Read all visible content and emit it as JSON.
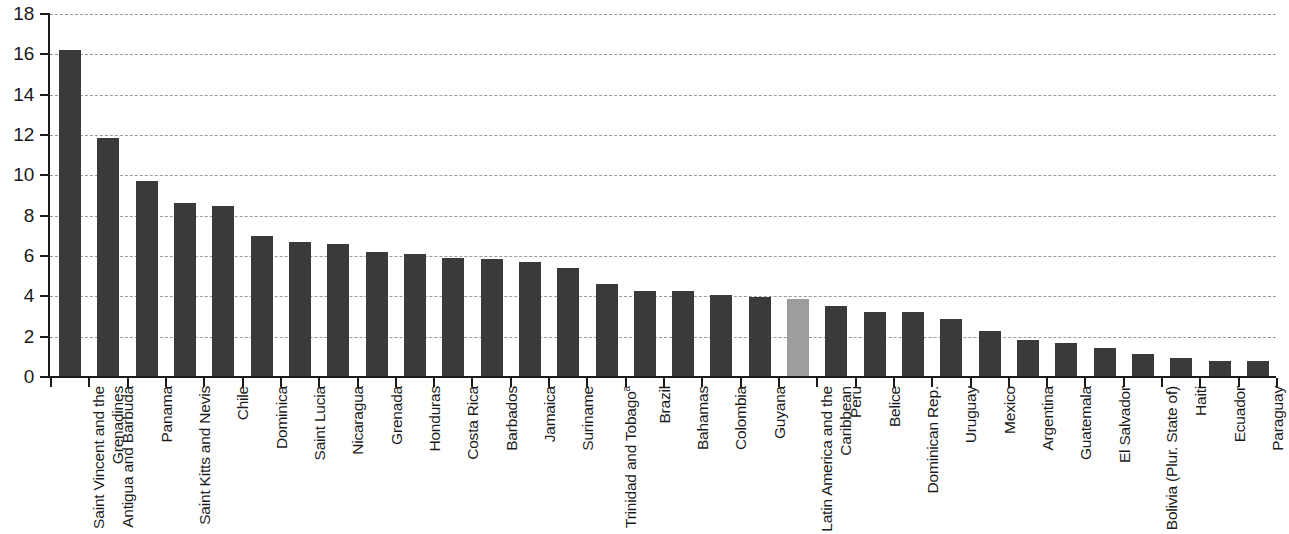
{
  "chart_data": {
    "type": "bar",
    "title": "",
    "subtitle": "",
    "xlabel": "",
    "ylabel": "",
    "ylim": [
      0,
      18
    ],
    "ytick_step": 2,
    "yticks": [
      "18",
      "16",
      "14",
      "12",
      "10",
      "8",
      "6",
      "4",
      "2",
      "0"
    ],
    "grid": true,
    "legend": false,
    "bar_color": "#3a3a3a",
    "highlight_color": "#9d9d9d",
    "highlight_category": "Latin America and the Caribbean",
    "footnote_marker": "a",
    "categories": [
      "Saint Vincent and the Grenadines",
      "Antigua and Barbuda",
      "Panama",
      "Saint Kitts and Nevis",
      "Chile",
      "Dominica",
      "Saint Lucia",
      "Nicaragua",
      "Grenada",
      "Honduras",
      "Costa Rica",
      "Barbados",
      "Jamaica",
      "Suriname",
      "Trinidad and Tobago",
      "Brazil",
      "Bahamas",
      "Colombia",
      "Guyana",
      "Latin America and the Caribbean",
      "Peru",
      "Belice",
      "Dominican Rep.",
      "Uruguay",
      "Mexico",
      "Argentina",
      "Guatemala",
      "El Salvador",
      "Bolivia (Plur. State of)",
      "Haiti",
      "Ecuador",
      "Paraguay"
    ],
    "values": [
      16.2,
      11.85,
      9.7,
      8.65,
      8.5,
      7.0,
      6.7,
      6.6,
      6.2,
      6.1,
      5.9,
      5.85,
      5.7,
      5.4,
      4.6,
      4.25,
      4.25,
      4.05,
      3.95,
      3.85,
      3.5,
      3.2,
      3.2,
      2.9,
      2.3,
      1.85,
      1.7,
      1.45,
      1.15,
      0.95,
      0.8,
      0.78
    ]
  }
}
